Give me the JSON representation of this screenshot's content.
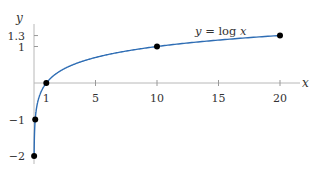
{
  "chart_data": {
    "type": "line",
    "title": "",
    "xlabel": "x",
    "ylabel": "y",
    "annotation": "y = log x",
    "xlim": [
      0,
      21.5
    ],
    "ylim": [
      -2.1,
      1.55
    ],
    "x_ticks": [
      1,
      5,
      10,
      15,
      20
    ],
    "y_ticks": [
      -2,
      -1,
      1,
      1.3
    ],
    "x_tick_labels": [
      "1",
      "5",
      "10",
      "15",
      "20"
    ],
    "y_tick_labels": [
      "-2",
      "-1",
      "1",
      "1.3"
    ],
    "grid": false,
    "series": [
      {
        "name": "y = log x",
        "function": "log10(x)",
        "color": "#2e6db4",
        "x_range": [
          0.01,
          20
        ]
      }
    ],
    "points": [
      {
        "x": 0.01,
        "y": -2
      },
      {
        "x": 0.1,
        "y": -1
      },
      {
        "x": 1,
        "y": 0
      },
      {
        "x": 10,
        "y": 1
      },
      {
        "x": 20,
        "y": 1.3
      }
    ]
  }
}
